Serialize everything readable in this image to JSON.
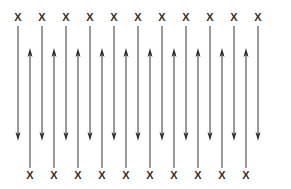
{
  "figure": {
    "canvas": {
      "width": 291,
      "height": 189,
      "background": "#ffffff"
    },
    "style": {
      "line_color": "#4a4745",
      "arrow_color": "#33302f",
      "label_color": "#33302f",
      "line_width": 1.1,
      "label_font_size": 11
    },
    "field_symbol": "X",
    "field_symbol_meaning": "magnetic-field-into-page",
    "top_labels": {
      "count": 11,
      "y": 21,
      "x_positions": [
        18,
        42,
        66,
        90,
        114,
        138,
        162,
        186,
        210,
        234,
        258
      ],
      "text": [
        "X",
        "X",
        "X",
        "X",
        "X",
        "X",
        "X",
        "X",
        "X",
        "X",
        "X"
      ]
    },
    "bottom_labels": {
      "count": 10,
      "y": 179,
      "x_positions": [
        30,
        54,
        78,
        102,
        126,
        150,
        174,
        198,
        222,
        246
      ],
      "text": [
        "X",
        "X",
        "X",
        "X",
        "X",
        "X",
        "X",
        "X",
        "X",
        "X"
      ]
    },
    "down_arrows": {
      "count": 11,
      "direction": "down",
      "x_positions": [
        18,
        42,
        66,
        90,
        114,
        138,
        162,
        186,
        210,
        234,
        258
      ],
      "y_start": 26,
      "y_tip": 141,
      "head_length": 9,
      "head_width": 5
    },
    "up_arrows": {
      "count": 10,
      "direction": "up",
      "x_positions": [
        30,
        54,
        78,
        102,
        126,
        150,
        174,
        198,
        222,
        246
      ],
      "y_start": 168,
      "y_tip": 48,
      "head_length": 9,
      "head_width": 5
    }
  }
}
